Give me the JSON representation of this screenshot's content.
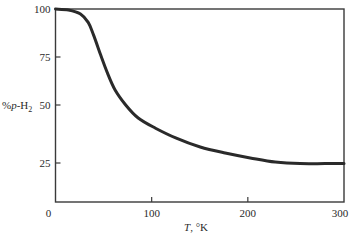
{
  "chart_data": {
    "type": "line",
    "title": "",
    "xlabel": "T, °K",
    "ylabel": "%p-H2",
    "ylabel_parts": {
      "prefix": "%",
      "italic": "p",
      "suffix": "-H",
      "subscript": "2"
    },
    "xlabel_parts": {
      "italic": "T",
      "suffix": ", °K"
    },
    "xlim": [
      0,
      300
    ],
    "ylim": [
      0,
      100
    ],
    "x_ticks": [
      0,
      100,
      200,
      300
    ],
    "y_ticks": [
      25,
      50,
      75,
      100
    ],
    "grid": false,
    "legend": null,
    "series": [
      {
        "name": "%p-H2 equilibrium",
        "x": [
          0,
          13.5,
          26,
          34,
          39.5,
          47,
          54,
          62,
          73,
          86,
          104,
          125,
          150.5,
          176.5,
          202.5,
          228.5,
          254.5,
          280,
          300
        ],
        "y": [
          100,
          99.5,
          97.4,
          93,
          86.5,
          76,
          66.7,
          57.8,
          50,
          44.4,
          40,
          35.8,
          31.9,
          29.3,
          27.2,
          25.4,
          24.6,
          24.6,
          24.6
        ]
      }
    ]
  },
  "colors": {
    "line": "#2a2a2a",
    "axis": "#3a3a3a",
    "background": "#ffffff"
  }
}
